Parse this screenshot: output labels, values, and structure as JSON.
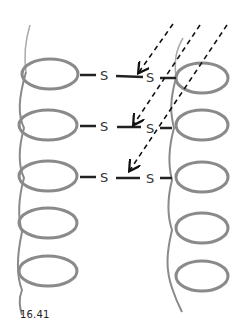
{
  "figure": {
    "caption": "16.41"
  },
  "helices": [
    {
      "name": "left-helix",
      "side": "left",
      "turns": 5
    },
    {
      "name": "right-helix",
      "side": "right",
      "turns": 5
    }
  ],
  "bonds": [
    {
      "left_atom": "S",
      "right_atom": "S"
    },
    {
      "left_atom": "S",
      "right_atom": "S"
    },
    {
      "left_atom": "S",
      "right_atom": "S"
    }
  ],
  "arrows": {
    "count": 3,
    "style": "dashed",
    "color": "#111111"
  },
  "colors": {
    "helix": "#8a8a8a",
    "helix_dark": "#6e6e6e",
    "bond": "#222222",
    "text": "#333333"
  }
}
